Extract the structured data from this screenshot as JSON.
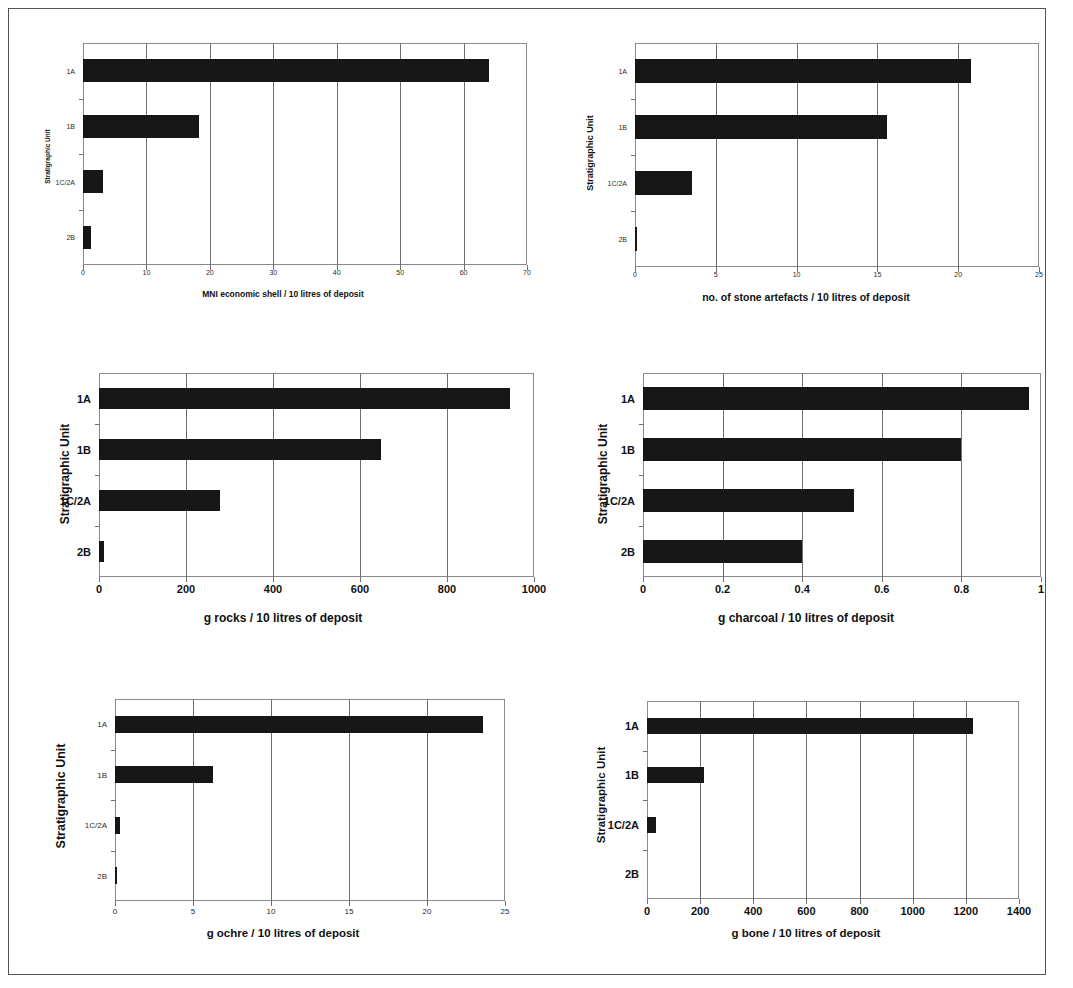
{
  "page": {
    "border_color": "#555555",
    "background": "#ffffff",
    "bar_color": "#171717",
    "axis_color": "#6f6f6f"
  },
  "common": {
    "y_axis_title": "Stratigraphic Unit",
    "categories": [
      "1A",
      "1B",
      "1C/2A",
      "2B"
    ]
  },
  "chart_data": [
    {
      "id": "shell",
      "type": "bar",
      "orientation": "horizontal",
      "title": "",
      "xlabel": "MNI economic shell / 10 litres of deposit",
      "ylabel": "Stratigraphic Unit",
      "categories": [
        "1A",
        "1B",
        "1C/2A",
        "2B"
      ],
      "values": [
        64,
        18.3,
        3.2,
        1.3
      ],
      "xlim": [
        0,
        70
      ],
      "xticks": [
        0,
        10,
        20,
        30,
        40,
        50,
        60,
        70
      ],
      "xticklabels": [
        "0",
        "10",
        "20",
        "30",
        "40",
        "50",
        "60",
        "70"
      ],
      "grid": "vertical",
      "legend": "none"
    },
    {
      "id": "stone_artefacts",
      "type": "bar",
      "orientation": "horizontal",
      "title": "",
      "xlabel": "no. of stone artefacts / 10 litres of deposit",
      "ylabel": "Stratigraphic Unit",
      "categories": [
        "1A",
        "1B",
        "1C/2A",
        "2B"
      ],
      "values": [
        20.8,
        15.6,
        3.5,
        0.15
      ],
      "xlim": [
        0,
        25
      ],
      "xticks": [
        0,
        5,
        10,
        15,
        20,
        25
      ],
      "xticklabels": [
        "0",
        "5",
        "10",
        "15",
        "20",
        "25"
      ],
      "grid": "vertical",
      "legend": "none"
    },
    {
      "id": "rocks",
      "type": "bar",
      "orientation": "horizontal",
      "title": "",
      "xlabel": "g rocks / 10 litres of deposit",
      "ylabel": "Stratigraphic Unit",
      "categories": [
        "1A",
        "1B",
        "1C/2A",
        "2B"
      ],
      "values": [
        945,
        648,
        278,
        12
      ],
      "xlim": [
        0,
        1000
      ],
      "xticks": [
        0,
        200,
        400,
        600,
        800,
        1000
      ],
      "xticklabels": [
        "0",
        "200",
        "400",
        "600",
        "800",
        "1000"
      ],
      "grid": "vertical",
      "legend": "none"
    },
    {
      "id": "charcoal",
      "type": "bar",
      "orientation": "horizontal",
      "title": "",
      "xlabel": "g charcoal / 10 litres of deposit",
      "ylabel": "Stratigraphic Unit",
      "categories": [
        "1A",
        "1B",
        "1C/2A",
        "2B"
      ],
      "values": [
        0.97,
        0.8,
        0.53,
        0.4
      ],
      "xlim": [
        0,
        1
      ],
      "xticks": [
        0,
        0.2,
        0.4,
        0.6,
        0.8,
        1
      ],
      "xticklabels": [
        "0",
        "0.2",
        "0.4",
        "0.6",
        "0.8",
        "1"
      ],
      "grid": "vertical",
      "legend": "none"
    },
    {
      "id": "ochre",
      "type": "bar",
      "orientation": "horizontal",
      "title": "",
      "xlabel": "g ochre / 10 litres of deposit",
      "ylabel": "Stratigraphic Unit",
      "categories": [
        "1A",
        "1B",
        "1C/2A",
        "2B"
      ],
      "values": [
        23.6,
        6.3,
        0.35,
        0.1
      ],
      "xlim": [
        0,
        25
      ],
      "xticks": [
        0,
        5,
        10,
        15,
        20,
        25
      ],
      "xticklabels": [
        "0",
        "5",
        "10",
        "15",
        "20",
        "25"
      ],
      "grid": "vertical",
      "legend": "none"
    },
    {
      "id": "bone",
      "type": "bar",
      "orientation": "horizontal",
      "title": "",
      "xlabel": "g bone / 10 litres of deposit",
      "ylabel": "Stratigraphic Unit",
      "categories": [
        "1A",
        "1B",
        "1C/2A",
        "2B"
      ],
      "values": [
        1225,
        215,
        35,
        0
      ],
      "xlim": [
        0,
        1400
      ],
      "xticks": [
        0,
        200,
        400,
        600,
        800,
        1000,
        1200,
        1400
      ],
      "xticklabels": [
        "0",
        "200",
        "400",
        "600",
        "800",
        "1000",
        "1200",
        "1400"
      ],
      "grid": "vertical",
      "legend": "none"
    }
  ]
}
